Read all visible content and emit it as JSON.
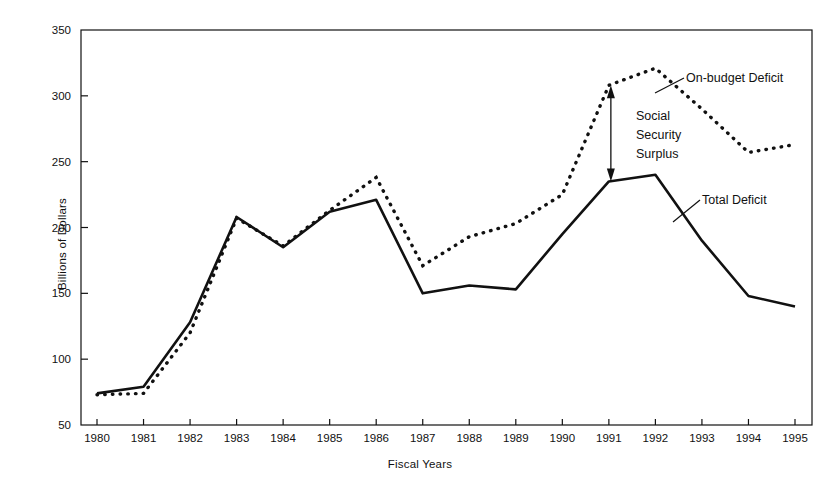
{
  "chart_data": {
    "type": "line",
    "title": "",
    "xlabel": "Fiscal Years",
    "ylabel": "Billions of Dollars",
    "categories": [
      "1980",
      "1981",
      "1982",
      "1983",
      "1984",
      "1985",
      "1986",
      "1987",
      "1988",
      "1989",
      "1990",
      "1991",
      "1992",
      "1993",
      "1994",
      "1995"
    ],
    "x": [
      1980,
      1981,
      1982,
      1983,
      1984,
      1985,
      1986,
      1987,
      1988,
      1989,
      1990,
      1991,
      1992,
      1993,
      1994,
      1995
    ],
    "xlim": [
      1980,
      1995
    ],
    "ylim": [
      50,
      350
    ],
    "ytick_labels": [
      "350",
      "300",
      "250",
      "200",
      "150",
      "100",
      "50"
    ],
    "yticks": [
      350,
      300,
      250,
      200,
      150,
      100,
      50
    ],
    "grid": false,
    "legend": "none",
    "series": [
      {
        "name": "On-budget Deficit",
        "style": "dotted",
        "color": "#111111",
        "values": [
          73,
          74,
          120,
          207,
          186,
          213,
          238,
          171,
          193,
          203,
          225,
          308,
          321,
          290,
          257,
          263
        ]
      },
      {
        "name": "Total Deficit",
        "style": "solid",
        "color": "#111111",
        "values": [
          74,
          79,
          128,
          208,
          185,
          212,
          221,
          150,
          156,
          153,
          195,
          235,
          240,
          190,
          148,
          140
        ]
      }
    ],
    "annotations": [
      {
        "name": "on-budget-deficit-label",
        "text": "On-budget Deficit",
        "leader": true
      },
      {
        "name": "total-deficit-label",
        "text": "Total Deficit",
        "leader": true
      },
      {
        "name": "social-security-surplus-label",
        "text": [
          "Social",
          "Security",
          "Surplus"
        ],
        "arrow": "double-headed-vertical",
        "at_year": 1991,
        "from_value": 308,
        "to_value": 235
      }
    ]
  },
  "annotation_text": {
    "on_budget": "On-budget Deficit",
    "total": "Total Deficit",
    "ss_line1": "Social",
    "ss_line2": "Security",
    "ss_line3": "Surplus"
  }
}
